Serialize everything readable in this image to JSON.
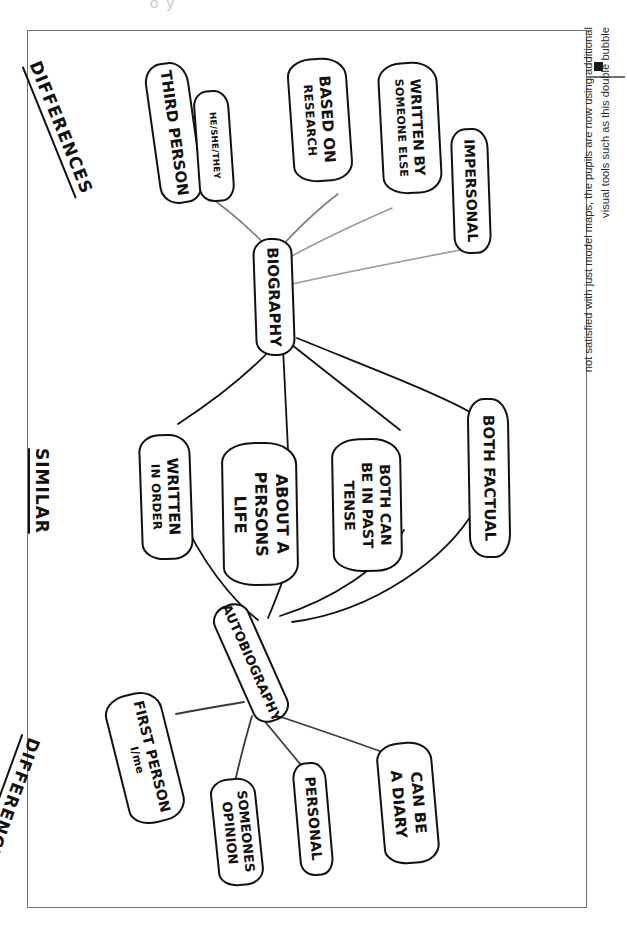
{
  "page": {
    "top_bleed_text": "o  y  ",
    "caption": {
      "bullet": "square-bullet",
      "text": "not satisfied with just model maps, the pupils are now using additional\nvisual tools such as this double bubble"
    }
  },
  "diagram": {
    "type": "double-bubble-map",
    "headings": [
      {
        "id": "differences-top",
        "label": "DIFFERENCES"
      },
      {
        "id": "similar",
        "label": "SIMILAR"
      },
      {
        "id": "differences-bottom",
        "label": "DIFFERENCES"
      }
    ],
    "centers": [
      {
        "id": "biography",
        "label": "BIOGRAPHY"
      },
      {
        "id": "autobiography",
        "label": "AUTOBIOGRAPHY"
      }
    ],
    "shared_attributes": [
      {
        "id": "written-in-order",
        "line1": "WRITTEN",
        "line2": "IN ORDER"
      },
      {
        "id": "about-a-persons-life",
        "line1": "ABOUT A",
        "line2": "PERSONS",
        "line3": "LIFE"
      },
      {
        "id": "both-past-tense",
        "line1": "BOTH CAN",
        "line2": "BE IN PAST",
        "line3": "TENSE"
      },
      {
        "id": "both-factual",
        "line1": "BOTH FACTUAL",
        "line2": ""
      }
    ],
    "biography_attributes": [
      {
        "id": "third-person",
        "line1": "THIRD PERSON",
        "line2": "HE/SHE/THEY"
      },
      {
        "id": "based-on-research",
        "line1": "BASED ON",
        "line2": "RESEARCH"
      },
      {
        "id": "written-by-someone-else",
        "line1": "WRITTEN BY",
        "line2": "SOMEONE ELSE"
      },
      {
        "id": "impersonal",
        "line1": "IMPERSONAL",
        "line2": ""
      }
    ],
    "autobiography_attributes": [
      {
        "id": "first-person",
        "line1": "FIRST PERSON",
        "line2": "I/me"
      },
      {
        "id": "someones-opinion",
        "line1": "SOMEONES",
        "line2": "OPINION"
      },
      {
        "id": "personal",
        "line1": "PERSONAL",
        "line2": ""
      },
      {
        "id": "can-be-a-diary",
        "line1": "CAN BE",
        "line2": "A DIARY"
      }
    ],
    "colors": {
      "ink": "#111111",
      "frame": "#6f6f6f",
      "faint_edge": "#9a9a9a",
      "paper": "#ffffff"
    }
  }
}
